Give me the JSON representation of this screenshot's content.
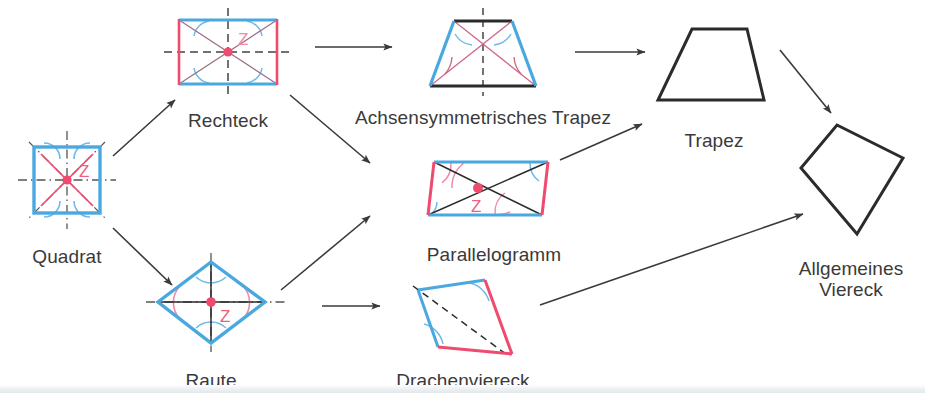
{
  "diagram": {
    "language": "de",
    "background_color": "#ffffff",
    "palette": {
      "blue": "#4aa8e0",
      "pink": "#ef4b6e",
      "black": "#2b2b2b",
      "arrow": "#3a3a3a",
      "label_text": "#3a3a3a",
      "arc_blue": "#6fb9e8",
      "arc_pink": "#ef8aa2"
    },
    "nodes": [
      {
        "id": "quadrat",
        "label": "Quadrat",
        "shape": "square",
        "center_symbol": "Z",
        "label_x": 67,
        "label_y": 238,
        "features": [
          "4 blue sides",
          "pink diagonals",
          "dash-dot symmetry axes",
          "blue right-angle arcs",
          "pink center point Z"
        ]
      },
      {
        "id": "rechteck",
        "label": "Rechteck",
        "shape": "rectangle",
        "center_symbol": "Z",
        "label_x": 228,
        "label_y": 102,
        "features": [
          "blue horizontal sides",
          "pink vertical sides",
          "pink diagonals",
          "dashed symmetry axes",
          "blue angle arcs",
          "pink center point Z"
        ]
      },
      {
        "id": "achsensymmetrisches-trapez",
        "label": "Achsensymmetrisches Trapez",
        "shape": "isosceles-trapezoid",
        "center_symbol": "",
        "label_x": 483,
        "label_y": 99,
        "features": [
          "blue legs",
          "black parallel sides",
          "pink diagonals",
          "dashed vertical symmetry axis",
          "blue and pink angle arcs"
        ]
      },
      {
        "id": "trapez",
        "label": "Trapez",
        "shape": "trapezoid",
        "center_symbol": "",
        "label_x": 714,
        "label_y": 122,
        "features": [
          "plain black outline"
        ]
      },
      {
        "id": "parallelogramm",
        "label": "Parallelogramm",
        "shape": "parallelogram",
        "center_symbol": "Z",
        "label_x": 494,
        "label_y": 236,
        "features": [
          "blue horizontal sides",
          "pink slanted sides",
          "black diagonals",
          "pink and blue angle arcs",
          "pink center point Z"
        ]
      },
      {
        "id": "raute",
        "label": "Raute",
        "shape": "rhombus",
        "center_symbol": "Z",
        "label_x": 211,
        "label_y": 362,
        "features": [
          "4 blue sides",
          "black diagonals",
          "dash-dot symmetry axes",
          "pink side arcs",
          "blue top and bottom arcs",
          "pink center point Z"
        ]
      },
      {
        "id": "drachenviereck",
        "label": "Drachenviereck",
        "shape": "kite",
        "center_symbol": "",
        "label_x": 463,
        "label_y": 362,
        "features": [
          "blue upper-left sides",
          "pink lower-right sides",
          "dashed axis of symmetry",
          "blue angle arcs"
        ]
      },
      {
        "id": "allgemeines-viereck",
        "label": "Allgemeines\nViereck",
        "shape": "general-quadrilateral",
        "center_symbol": "",
        "label_x": 851,
        "label_y": 251,
        "features": [
          "plain black outline"
        ]
      }
    ],
    "arrows": [
      {
        "id": "quadrat-to-rechteck",
        "from": "quadrat",
        "to": "rechteck",
        "x1": 113,
        "y1": 156,
        "x2": 175,
        "y2": 100
      },
      {
        "id": "quadrat-to-raute",
        "from": "quadrat",
        "to": "raute",
        "x1": 113,
        "y1": 228,
        "x2": 172,
        "y2": 285
      },
      {
        "id": "rechteck-to-achsensymmetrisches-trapez",
        "from": "rechteck",
        "to": "achsensymmetrisches-trapez",
        "x1": 315,
        "y1": 47,
        "x2": 392,
        "y2": 47
      },
      {
        "id": "rechteck-to-parallelogramm",
        "from": "rechteck",
        "to": "parallelogramm",
        "x1": 290,
        "y1": 95,
        "x2": 370,
        "y2": 163
      },
      {
        "id": "achsensymmetrisches-trapez-to-trapez",
        "from": "achsensymmetrisches-trapez",
        "to": "trapez",
        "x1": 575,
        "y1": 52,
        "x2": 645,
        "y2": 52
      },
      {
        "id": "raute-to-parallelogramm",
        "from": "raute",
        "to": "parallelogramm",
        "x1": 281,
        "y1": 290,
        "x2": 370,
        "y2": 216
      },
      {
        "id": "raute-to-drachenviereck",
        "from": "raute",
        "to": "drachenviereck",
        "x1": 322,
        "y1": 306,
        "x2": 380,
        "y2": 306
      },
      {
        "id": "parallelogramm-to-trapez",
        "from": "parallelogramm",
        "to": "trapez",
        "x1": 560,
        "y1": 160,
        "x2": 642,
        "y2": 124
      },
      {
        "id": "trapez-to-allgemeines-viereck",
        "from": "trapez",
        "to": "allgemeines-viereck",
        "x1": 780,
        "y1": 50,
        "x2": 831,
        "y2": 113
      },
      {
        "id": "drachenviereck-to-allgemeines-viereck",
        "from": "drachenviereck",
        "to": "allgemeines-viereck",
        "x1": 540,
        "y1": 305,
        "x2": 803,
        "y2": 214
      }
    ]
  }
}
